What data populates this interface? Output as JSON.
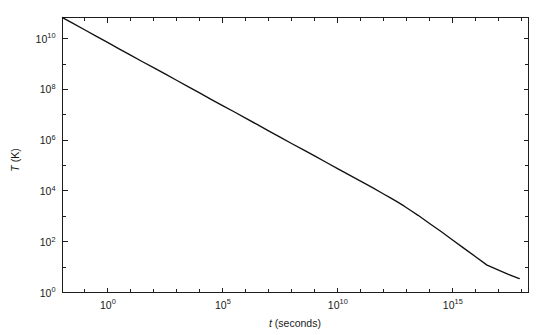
{
  "chart_data": {
    "type": "line",
    "title": "",
    "subtitle": "",
    "xlabel": "t (seconds)",
    "ylabel": "T (K)",
    "xscale": "log",
    "yscale": "log",
    "xlim": [
      0.011,
      2e+18
    ],
    "ylim": [
      1.0,
      68000000000.0
    ],
    "grid": false,
    "legend": null,
    "xticks": [
      {
        "value": 1.0,
        "label": "10",
        "exponent": "0"
      },
      {
        "value": 100000.0,
        "label": "10",
        "exponent": "5"
      },
      {
        "value": 10000000000.0,
        "label": "10",
        "exponent": "10"
      },
      {
        "value": 1000000000000000.0,
        "label": "10",
        "exponent": "15"
      }
    ],
    "xminor_decades": [
      -1,
      0,
      1,
      2,
      3,
      4,
      5,
      6,
      7,
      8,
      9,
      10,
      11,
      12,
      13,
      14,
      15,
      16,
      17,
      18
    ],
    "yticks": [
      {
        "value": 1.0,
        "label": "10",
        "exponent": "0"
      },
      {
        "value": 100.0,
        "label": "10",
        "exponent": "2"
      },
      {
        "value": 10000.0,
        "label": "10",
        "exponent": "4"
      },
      {
        "value": 1000000.0,
        "label": "10",
        "exponent": "6"
      },
      {
        "value": 100000000.0,
        "label": "10",
        "exponent": "8"
      },
      {
        "value": 10000000000.0,
        "label": "10",
        "exponent": "10"
      }
    ],
    "yminor_decades": [
      1,
      3,
      5,
      7,
      9
    ],
    "series": [
      {
        "name": "Universe temperature",
        "color": "#111111",
        "points": [
          [
            -1.96,
            10.83
          ],
          [
            -1.5,
            10.6
          ],
          [
            -1.0,
            10.35
          ],
          [
            -0.5,
            10.1
          ],
          [
            0.0,
            9.85
          ],
          [
            0.5,
            9.6
          ],
          [
            1.0,
            9.35
          ],
          [
            1.5,
            9.1
          ],
          [
            2.0,
            8.86
          ],
          [
            2.5,
            8.61
          ],
          [
            3.0,
            8.36
          ],
          [
            3.5,
            8.11
          ],
          [
            4.0,
            7.86
          ],
          [
            4.5,
            7.61
          ],
          [
            5.0,
            7.36
          ],
          [
            5.5,
            7.12
          ],
          [
            6.0,
            6.87
          ],
          [
            6.5,
            6.62
          ],
          [
            7.0,
            6.37
          ],
          [
            7.5,
            6.12
          ],
          [
            8.0,
            5.87
          ],
          [
            8.5,
            5.63
          ],
          [
            9.0,
            5.38
          ],
          [
            9.5,
            5.13
          ],
          [
            10.0,
            4.88
          ],
          [
            10.5,
            4.63
          ],
          [
            11.0,
            4.39
          ],
          [
            11.5,
            4.14
          ],
          [
            12.0,
            3.88
          ],
          [
            12.3,
            3.73
          ],
          [
            12.6,
            3.57
          ],
          [
            12.9,
            3.4
          ],
          [
            13.2,
            3.22
          ],
          [
            13.5,
            3.04
          ],
          [
            14.0,
            2.72
          ],
          [
            14.5,
            2.4
          ],
          [
            15.0,
            2.07
          ],
          [
            15.5,
            1.74
          ],
          [
            16.0,
            1.41
          ],
          [
            16.5,
            1.08
          ],
          [
            17.0,
            0.88
          ],
          [
            17.4,
            0.72
          ],
          [
            17.9,
            0.55
          ]
        ]
      }
    ]
  },
  "axes": {
    "x_title_symbol": "t",
    "x_title_unit": " (seconds)",
    "y_title": "T (K)"
  }
}
